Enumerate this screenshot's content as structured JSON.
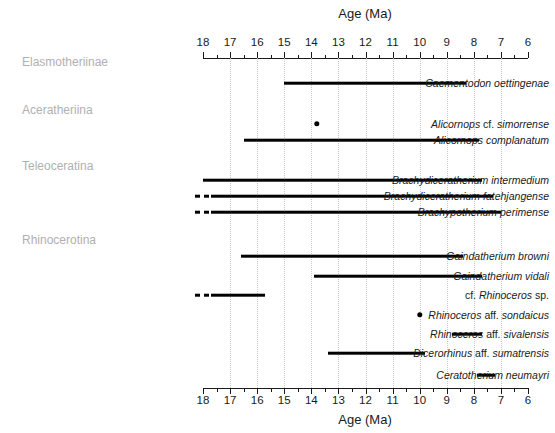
{
  "chart_data": {
    "type": "bar",
    "title": "",
    "xlabel": "Age (Ma)",
    "xlabel_top": "Age (Ma)",
    "ylabel": "",
    "xlim": [
      18,
      6
    ],
    "x_axis_reversed": true,
    "x_major_ticks": [
      18,
      17,
      16,
      15,
      14,
      13,
      12,
      11,
      10,
      9,
      8,
      7,
      6
    ],
    "x_minor_ticks": [
      17.5,
      16.5,
      15.5,
      14.5,
      13.5,
      12.5,
      11.5,
      10.5,
      9.5,
      8.5,
      7.5,
      6.5
    ],
    "x_tick_labels": [
      "18",
      "17",
      "16",
      "15",
      "14",
      "13",
      "12",
      "11",
      "10",
      "9",
      "8",
      "7",
      "6"
    ],
    "grid": true,
    "grid_axis": "x",
    "grid_style": "dotted",
    "legend": "none",
    "units": "Ma",
    "orientation": "horizontal-range",
    "rows": [
      {
        "kind": "group",
        "label": "Elasmotheriinae"
      },
      {
        "kind": "range",
        "label": "Caementodon oettingenae",
        "style": "italic",
        "start": 15.0,
        "end": 8.3,
        "dashed_start": null
      },
      {
        "kind": "group",
        "label": "Aceratheriina"
      },
      {
        "kind": "point",
        "label": "Alicornops cf. simorrense",
        "style": "italic-cf",
        "value": 13.8
      },
      {
        "kind": "range",
        "label": "Alicornops complanatum",
        "style": "italic",
        "start": 16.5,
        "end": 7.8,
        "dashed_start": null
      },
      {
        "kind": "group",
        "label": "Teleoceratina"
      },
      {
        "kind": "range",
        "label": "Brachydiceratherium intermedium",
        "style": "italic",
        "start": 18.0,
        "end": 7.7,
        "dashed_start": null
      },
      {
        "kind": "range",
        "label": "Brachydiceratherium fatehjangense",
        "style": "italic",
        "start": 17.7,
        "end": 7.3,
        "dashed_start": 18.3
      },
      {
        "kind": "range",
        "label": "Brachypotherium perimense",
        "style": "italic",
        "start": 17.7,
        "end": 7.0,
        "dashed_start": 18.3
      },
      {
        "kind": "group",
        "label": "Rhinocerotina"
      },
      {
        "kind": "range",
        "label": "Gaindatherium browni",
        "style": "italic",
        "start": 16.6,
        "end": 8.4,
        "dashed_start": null
      },
      {
        "kind": "range",
        "label": "Gaindatherium vidali",
        "style": "italic",
        "start": 13.9,
        "end": 7.7,
        "dashed_start": null
      },
      {
        "kind": "range",
        "label": "cf. Rhinoceros sp.",
        "style": "cf-italic-sp",
        "start": 17.7,
        "end": 15.7,
        "dashed_start": 18.3
      },
      {
        "kind": "point",
        "label": "Rhinoceros aff. sondaicus",
        "style": "italic-aff",
        "value": 10.0
      },
      {
        "kind": "range",
        "label": "Rhinoceros aff. sivalensis",
        "style": "italic-aff",
        "start": 8.8,
        "end": 7.7,
        "dashed_start": null
      },
      {
        "kind": "range",
        "label": "Dicerorhinus aff. sumatrensis",
        "style": "italic-aff",
        "start": 13.4,
        "end": 9.8,
        "dashed_start": null
      },
      {
        "kind": "range",
        "label": "Ceratotherium neumayri",
        "style": "italic",
        "start": 7.9,
        "end": 7.2,
        "dashed_start": null
      }
    ]
  },
  "axis": {
    "top_title": "Age (Ma)",
    "bottom_title": "Age (Ma)"
  },
  "colors": {
    "bar": "#000000",
    "grid": "#c9c9c9",
    "group_label": "#b0b0b0",
    "taxon_label": "#1a1a1a",
    "axis": "#1a1a1a",
    "background": "#ffffff"
  }
}
